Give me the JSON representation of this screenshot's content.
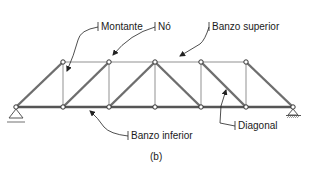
{
  "figure": {
    "caption": "(b)",
    "labels": {
      "montante": "Montante",
      "no": "Nó",
      "banzo_superior": "Banzo superior",
      "banzo_inferior": "Banzo inferior",
      "diagonal": "Diagonal"
    },
    "colors": {
      "bottom_chord": "#555555",
      "diagonal": "#6e6e6e",
      "top_chord": "#c8c8c8",
      "vertical": "#c8c8c8",
      "text": "#1a1a1a"
    },
    "nodes": {
      "bottom": [
        [
          16,
          107
        ],
        [
          63,
          107
        ],
        [
          109,
          107
        ],
        [
          155,
          107
        ],
        [
          201,
          107
        ],
        [
          246,
          107
        ],
        [
          293,
          107
        ]
      ],
      "top": [
        [
          63,
          62
        ],
        [
          109,
          62
        ],
        [
          155,
          62
        ],
        [
          201,
          62
        ],
        [
          246,
          62
        ]
      ]
    },
    "supports": {
      "left": "pin",
      "right": "roller"
    }
  }
}
